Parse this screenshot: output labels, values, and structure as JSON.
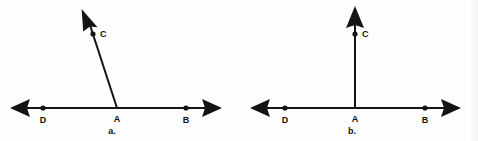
{
  "figure": {
    "type": "geometry-diagram",
    "background_color": "#fefefe",
    "ink_color": "#141414",
    "width": 478,
    "height": 141
  },
  "diagrams": [
    {
      "caption": "a.",
      "caption_x": 112,
      "caption_y": 134,
      "baseline_y": 108,
      "vertex": {
        "label": "A",
        "x": 117,
        "y": 108,
        "label_x": 117,
        "label_y": 122,
        "has_dot": false
      },
      "line_left_end": {
        "x": 16,
        "y": 108
      },
      "line_right_end": {
        "x": 216,
        "y": 108
      },
      "points": [
        {
          "label": "D",
          "x": 43,
          "y": 108,
          "label_x": 43,
          "label_y": 123,
          "has_dot": true
        },
        {
          "label": "B",
          "x": 186,
          "y": 108,
          "label_x": 186,
          "label_y": 123,
          "has_dot": true
        },
        {
          "label": "C",
          "x": 92,
          "y": 33,
          "label_x": 101,
          "label_y": 36,
          "has_dot": true
        }
      ],
      "ray": {
        "from_x": 117,
        "from_y": 108,
        "to_x": 87,
        "to_y": 16,
        "is_vertical": false,
        "angle_note": "slanted up-left, obtuse angle CAB"
      }
    },
    {
      "caption": "b.",
      "caption_x": 352,
      "caption_y": 134,
      "baseline_y": 108,
      "vertex": {
        "label": "A",
        "x": 355,
        "y": 108,
        "label_x": 355,
        "label_y": 122,
        "has_dot": false
      },
      "line_left_end": {
        "x": 256,
        "y": 108
      },
      "line_right_end": {
        "x": 455,
        "y": 108
      },
      "points": [
        {
          "label": "D",
          "x": 285,
          "y": 108,
          "label_x": 285,
          "label_y": 123,
          "has_dot": true
        },
        {
          "label": "B",
          "x": 425,
          "y": 108,
          "label_x": 425,
          "label_y": 123,
          "has_dot": true
        },
        {
          "label": "C",
          "x": 355,
          "y": 33,
          "label_x": 364,
          "label_y": 36,
          "has_dot": true
        }
      ],
      "ray": {
        "from_x": 355,
        "from_y": 108,
        "to_x": 355,
        "to_y": 14,
        "is_vertical": true,
        "angle_note": "perfectly vertical, right angle CAB"
      }
    }
  ]
}
